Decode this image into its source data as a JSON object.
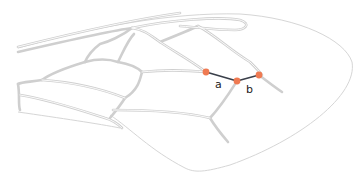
{
  "diagram": {
    "type": "insect-wing-venation",
    "colors": {
      "vein": "#cfcfcf",
      "margin": "#d6d6d6",
      "measure_line": "#3a3f4a",
      "landmark_point": "#ef7a52"
    },
    "landmarks": [
      {
        "id": "p1",
        "x": 206,
        "y": 72
      },
      {
        "id": "p2",
        "x": 237,
        "y": 81
      },
      {
        "id": "p3",
        "x": 259,
        "y": 75
      }
    ],
    "segments": [
      {
        "label": "a",
        "from": "p1",
        "to": "p2"
      },
      {
        "label": "b",
        "from": "p2",
        "to": "p3"
      }
    ]
  },
  "labels": {
    "a": "a",
    "b": "b"
  }
}
